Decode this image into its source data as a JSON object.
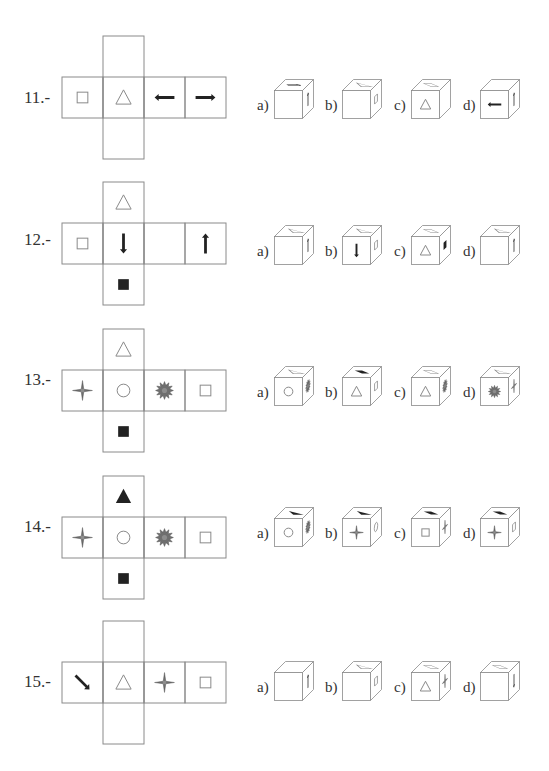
{
  "problems": [
    {
      "number": "11.-",
      "net": {
        "row": [
          "square-outline",
          "triangle-outline",
          "arrow-left",
          "arrow-right"
        ],
        "top": "empty",
        "bottom": "empty"
      },
      "options": [
        {
          "label": "a)",
          "front": "empty",
          "top": "arrow-right",
          "right": "arrow-up"
        },
        {
          "label": "b)",
          "front": "empty",
          "top": "triangle-outline",
          "right": "square-outline"
        },
        {
          "label": "c)",
          "front": "triangle-outline",
          "top": "square-outline",
          "right": "empty"
        },
        {
          "label": "d)",
          "front": "arrow-left",
          "top": "empty",
          "right": "arrow-up"
        }
      ]
    },
    {
      "number": "12.-",
      "net": {
        "row": [
          "square-outline",
          "arrow-down",
          "empty",
          "arrow-up"
        ],
        "top": "triangle-outline",
        "bottom": "square-filled"
      },
      "options": [
        {
          "label": "a)",
          "front": "empty",
          "top": "triangle-outline",
          "right": "arrow-up"
        },
        {
          "label": "b)",
          "front": "arrow-down",
          "top": "triangle-outline",
          "right": "square-outline"
        },
        {
          "label": "c)",
          "front": "triangle-outline",
          "top": "square-outline",
          "right": "square-filled"
        },
        {
          "label": "d)",
          "front": "empty",
          "top": "triangle-outline",
          "right": "arrow-up"
        }
      ]
    },
    {
      "number": "13.-",
      "net": {
        "row": [
          "star-4point",
          "circle-outline",
          "star-burst",
          "square-outline"
        ],
        "top": "triangle-outline",
        "bottom": "square-filled"
      },
      "options": [
        {
          "label": "a)",
          "front": "circle-outline",
          "top": "triangle-outline",
          "right": "star-burst"
        },
        {
          "label": "b)",
          "front": "triangle-outline",
          "top": "square-filled",
          "right": "square-outline"
        },
        {
          "label": "c)",
          "front": "triangle-outline",
          "top": "square-outline",
          "right": "star-burst"
        },
        {
          "label": "d)",
          "front": "star-burst",
          "top": "triangle-outline",
          "right": "star-4point"
        }
      ]
    },
    {
      "number": "14.-",
      "net": {
        "row": [
          "star-4point",
          "circle-outline",
          "star-burst",
          "square-outline"
        ],
        "top": "triangle-filled",
        "bottom": "square-filled"
      },
      "options": [
        {
          "label": "a)",
          "front": "circle-outline",
          "top": "triangle-filled",
          "right": "star-burst"
        },
        {
          "label": "b)",
          "front": "star-4point",
          "top": "triangle-filled",
          "right": "circle-outline"
        },
        {
          "label": "c)",
          "front": "square-outline",
          "top": "square-filled",
          "right": "star-4point"
        },
        {
          "label": "d)",
          "front": "star-4point",
          "top": "square-filled",
          "right": "square-outline"
        }
      ]
    },
    {
      "number": "15.-",
      "net": {
        "row": [
          "arrow-diag-down-right",
          "triangle-outline",
          "star-4point",
          "square-outline"
        ],
        "top": "empty",
        "bottom": "empty"
      },
      "options": [
        {
          "label": "a)",
          "front": "empty",
          "top": "empty",
          "right": "arrow-up"
        },
        {
          "label": "b)",
          "front": "empty",
          "top": "triangle-outline",
          "right": "square-outline"
        },
        {
          "label": "c)",
          "front": "triangle-outline",
          "top": "square-outline",
          "right": "star-4point"
        },
        {
          "label": "d)",
          "front": "empty",
          "top": "square-outline",
          "right": "arrow-down"
        }
      ]
    }
  ],
  "colors": {
    "line": "#8a8a8a",
    "ink": "#222222",
    "star_fill": "#6f6f6f",
    "star_center": "#8d8d8d"
  }
}
